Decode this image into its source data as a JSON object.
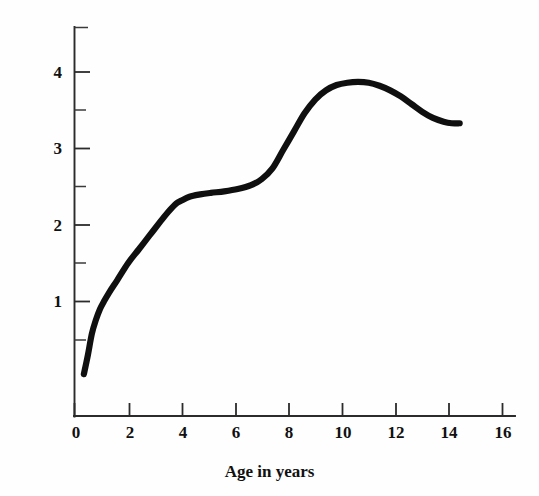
{
  "chart_data": {
    "type": "line",
    "title": "",
    "xlabel": "Age in years",
    "ylabel": "Hours per day",
    "xlim": [
      0,
      16.4
    ],
    "ylim": [
      0,
      4.5
    ],
    "xtick_labels": [
      "0",
      "2",
      "4",
      "6",
      "8",
      "10",
      "12",
      "14",
      "16"
    ],
    "xticks": [
      0,
      2,
      4,
      6,
      8,
      10,
      12,
      14,
      16
    ],
    "x_minor_ticks": [],
    "ytick_labels": [
      "1",
      "2",
      "3",
      "4"
    ],
    "yticks": [
      1,
      2,
      3,
      4
    ],
    "y_minor_ticks": [
      0.5,
      1.5,
      2.5,
      3.5,
      4.5
    ],
    "grid": false,
    "legend": false,
    "legend_position": "none",
    "line_color": "#100f0f",
    "background_color": "#fefefe",
    "axis_color": "#2b2b2b",
    "series": [
      {
        "name": "Hours per day",
        "x": [
          0.35,
          0.5,
          0.65,
          0.8,
          0.95,
          1.1,
          1.3,
          1.6,
          2.0,
          2.4,
          2.8,
          3.2,
          3.5,
          3.8,
          4.0,
          4.3,
          4.7,
          5.1,
          5.6,
          6.1,
          6.6,
          7.0,
          7.4,
          7.8,
          8.2,
          8.6,
          9.0,
          9.4,
          9.8,
          10.2,
          10.6,
          11.0,
          11.4,
          11.8,
          12.2,
          12.6,
          13.0,
          13.4,
          13.8,
          14.1,
          14.4
        ],
        "y": [
          0.05,
          0.3,
          0.58,
          0.76,
          0.9,
          1.0,
          1.12,
          1.28,
          1.5,
          1.68,
          1.86,
          2.04,
          2.17,
          2.28,
          2.32,
          2.37,
          2.4,
          2.42,
          2.44,
          2.47,
          2.52,
          2.6,
          2.74,
          2.98,
          3.22,
          3.46,
          3.64,
          3.76,
          3.83,
          3.86,
          3.87,
          3.86,
          3.82,
          3.76,
          3.68,
          3.58,
          3.48,
          3.4,
          3.35,
          3.33,
          3.33
        ]
      }
    ],
    "annotations": []
  },
  "axes": {
    "x_title": "Age in years",
    "y_title": "Hours per day",
    "x_labels": [
      "0",
      "2",
      "4",
      "6",
      "8",
      "10",
      "12",
      "14",
      "16"
    ],
    "y_labels": [
      "1",
      "2",
      "3",
      "4"
    ]
  }
}
